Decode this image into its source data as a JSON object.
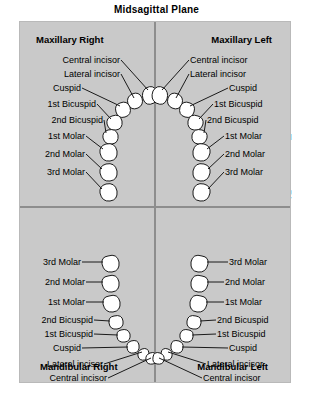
{
  "title": "Midsagittal Plane",
  "side_label": "Transverse Plane",
  "colors": {
    "panel_background": "#c9c9c9",
    "page_background": "#ffffff",
    "divider": "#8d8d8d",
    "tooth_fill": "#ffffff",
    "tooth_outline": "#1a1a1a",
    "text": "#000000"
  },
  "quadrants": {
    "maxillary_right": {
      "header": "Maxillary Right",
      "teeth": [
        "Central incisor",
        "Lateral incisor",
        "Cuspid",
        "1st Bicuspid",
        "2nd Bicuspid",
        "1st Molar",
        "2nd Molar",
        "3rd Molar"
      ]
    },
    "maxillary_left": {
      "header": "Maxillary Left",
      "teeth": [
        "Central incisor",
        "Lateral incisor",
        "Cuspid",
        "1st Bicuspid",
        "2nd Bicuspid",
        "1st Molar",
        "2nd Molar",
        "3rd Molar"
      ]
    },
    "mandibular_right": {
      "header": "Mandibular Right",
      "teeth": [
        "3rd Molar",
        "2nd Molar",
        "1st Molar",
        "2nd Bicuspid",
        "1st Bicuspid",
        "Cuspid",
        "Lateral incisor",
        "Central incisor"
      ]
    },
    "mandibular_left": {
      "header": "Mandibular Left",
      "teeth": [
        "3rd Molar",
        "2nd Molar",
        "1st Molar",
        "2nd Bicuspid",
        "1st Bicuspid",
        "Cuspid",
        "Lateral incisor",
        "Central incisor"
      ]
    }
  }
}
